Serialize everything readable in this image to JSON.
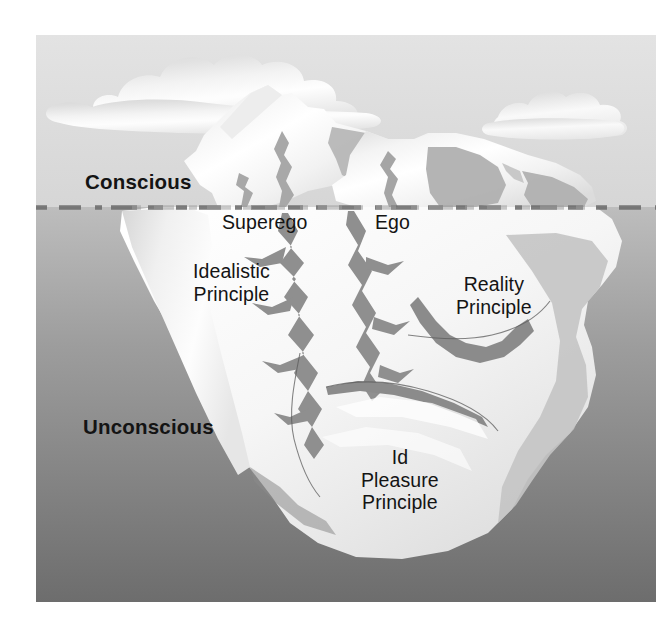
{
  "figure": {
    "page_background": "#ffffff",
    "frame": {
      "x": 36,
      "y": 35,
      "width": 620,
      "height": 567
    }
  },
  "palette": {
    "sky_top": "#e2e2e2",
    "sky_bottom": "#d9d9d9",
    "sea_top": "#b6b6b6",
    "sea_bottom": "#6e6e6e",
    "ice_light": "#fdfdfd",
    "ice_shadow": "#b9b9b9",
    "crack_dark": "#9a9a9a",
    "cloud": "#f7f7f7",
    "waterline": "#7d7d7d",
    "text": "#141414"
  },
  "labels": {
    "conscious": "Conscious",
    "unconscious": "Unconscious",
    "superego": "Superego",
    "ego": "Ego",
    "idealistic_principle": "Idealistic\nPrinciple",
    "reality_principle": "Reality\nPrinciple",
    "id_pleasure_principle": "Id\nPleasure\nPrinciple"
  },
  "regions": {
    "above_water": [
      "Conscious",
      "Superego",
      "Ego"
    ],
    "below_water": [
      "Unconscious",
      "Idealistic Principle",
      "Reality Principle",
      "Id Pleasure Principle"
    ]
  },
  "elements": {
    "clouds": 2,
    "waterline_style": "dashed",
    "iceberg_peaks": 2
  }
}
